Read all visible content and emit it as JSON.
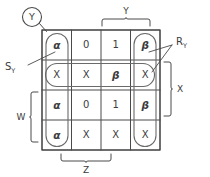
{
  "diagram": {
    "type": "karnaugh-map",
    "title_marker": "Y",
    "grid": {
      "rows": 4,
      "cols": 4,
      "cells": [
        [
          "α",
          "0",
          "1",
          "β"
        ],
        [
          "X",
          "X",
          "β",
          "X"
        ],
        [
          "α",
          "0",
          "1",
          "β"
        ],
        [
          "α",
          "X",
          "X",
          "X"
        ]
      ]
    },
    "callouts": {
      "circle_label": "Y",
      "left_label_main": "S",
      "left_label_sub": "Y",
      "right_label_main": "R",
      "right_label_sub": "Y"
    },
    "brackets": {
      "top": "Y",
      "right": "X",
      "left": "W",
      "bottom": "Z"
    },
    "colors": {
      "ink": "#3c3c3c",
      "line": "#555555",
      "background": "#ffffff"
    }
  }
}
